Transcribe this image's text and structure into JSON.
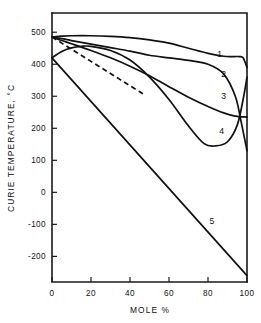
{
  "chart_data": {
    "type": "line",
    "title": "",
    "xlabel": "MOLE %",
    "ylabel": "CURIE TEMPERATURE, °C",
    "xlim": [
      0,
      100
    ],
    "ylim": [
      -280,
      560
    ],
    "grid": false,
    "legend": "inline-curve-labels",
    "xticks": [
      0,
      20,
      40,
      60,
      80,
      100
    ],
    "xtick_labels": [
      "0",
      "20",
      "40",
      "60",
      "80",
      "100"
    ],
    "yticks": [
      500,
      400,
      300,
      200,
      100,
      0,
      -100,
      -200
    ],
    "ytick_labels": [
      "500",
      "400",
      "300",
      "200",
      "100",
      "0",
      "-100",
      "-200"
    ],
    "series": [
      {
        "name": "1",
        "label": "1",
        "style": "solid",
        "label_x": 86,
        "label_y": 432,
        "x": [
          0,
          5,
          10,
          20,
          30,
          40,
          50,
          60,
          70,
          80,
          88,
          93,
          96,
          98,
          100
        ],
        "y": [
          485,
          488,
          489,
          489,
          487,
          483,
          476,
          466,
          450,
          434,
          425,
          424,
          424,
          420,
          390
        ]
      },
      {
        "name": "2",
        "label": "2",
        "style": "solid",
        "label_x": 88,
        "label_y": 370,
        "x": [
          0,
          5,
          10,
          20,
          30,
          40,
          50,
          60,
          70,
          80,
          88,
          94,
          97,
          100
        ],
        "y": [
          485,
          480,
          474,
          463,
          452,
          441,
          428,
          420,
          412,
          400,
          370,
          300,
          220,
          130
        ]
      },
      {
        "name": "3",
        "label": "3",
        "style": "solid",
        "label_x": 88,
        "label_y": 302,
        "x": [
          0,
          5,
          10,
          20,
          30,
          40,
          50,
          60,
          70,
          80,
          88,
          94,
          100
        ],
        "y": [
          485,
          474,
          464,
          443,
          420,
          394,
          364,
          330,
          297,
          268,
          248,
          238,
          235
        ]
      },
      {
        "name": "4",
        "label": "4",
        "style": "solid",
        "label_x": 87,
        "label_y": 190,
        "x": [
          0,
          5,
          10,
          15,
          20,
          30,
          40,
          50,
          60,
          70,
          78,
          84,
          90,
          95,
          98,
          100
        ],
        "y": [
          420,
          440,
          451,
          456,
          456,
          443,
          413,
          360,
          290,
          207,
          152,
          145,
          158,
          210,
          290,
          360
        ]
      },
      {
        "name": "5",
        "label": "5",
        "style": "solid",
        "label_x": 82,
        "label_y": -90,
        "x": [
          0,
          20,
          40,
          60,
          80,
          100
        ],
        "y": [
          420,
          284,
          148,
          12,
          -124,
          -260
        ]
      },
      {
        "name": "dashed",
        "label": "",
        "style": "dashed",
        "label_x": null,
        "label_y": null,
        "x": [
          0,
          5,
          10,
          15,
          20,
          25,
          30,
          35,
          40,
          45,
          48
        ],
        "y": [
          485,
          466,
          447,
          428,
          409,
          390,
          371,
          352,
          333,
          314,
          303
        ]
      }
    ]
  },
  "axes": {
    "x_axis_name": "mole-percent-axis",
    "y_axis_name": "curie-temperature-axis"
  }
}
